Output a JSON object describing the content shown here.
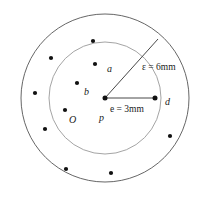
{
  "figure": {
    "colors": {
      "outer_circle_stroke": "#555555",
      "inner_circle_stroke": "#999999",
      "point_fill": "#111111",
      "line_stroke": "#333333",
      "text": "#1a1a1a",
      "background": "#ffffff"
    },
    "geometry": {
      "center_x": 105,
      "center_y": 98,
      "outer_radius": 84,
      "inner_radius": 56
    },
    "labels": {
      "a": "a",
      "b": "b",
      "O": "O",
      "p": "p",
      "d": "d",
      "outer_measure": "ε = 6mm",
      "inner_measure": "e = 3mm"
    },
    "label_positions": {
      "a": {
        "x": 107,
        "y": 64
      },
      "b": {
        "x": 84,
        "y": 87
      },
      "O": {
        "x": 69,
        "y": 115
      },
      "p": {
        "x": 99,
        "y": 113
      },
      "d": {
        "x": 165,
        "y": 97
      },
      "outer_measure": {
        "x": 142,
        "y": 63
      },
      "inner_measure": {
        "x": 110,
        "y": 105
      }
    },
    "points": [
      {
        "name": "point-inner-a",
        "x": 95,
        "y": 64,
        "r": 2.1
      },
      {
        "name": "point-inner-b",
        "x": 77,
        "y": 83,
        "r": 2.1
      },
      {
        "name": "point-inner-o",
        "x": 65,
        "y": 110,
        "r": 2.1
      },
      {
        "name": "point-center-p",
        "x": 105,
        "y": 98,
        "r": 2.4
      },
      {
        "name": "point-d",
        "x": 155,
        "y": 98,
        "r": 2.4
      },
      {
        "name": "point-outer-top",
        "x": 93,
        "y": 41,
        "r": 2.1
      },
      {
        "name": "point-outer-upper-left",
        "x": 51,
        "y": 58,
        "r": 2.1
      },
      {
        "name": "point-outer-left",
        "x": 35,
        "y": 93,
        "r": 2.1
      },
      {
        "name": "point-outer-lower-left",
        "x": 45,
        "y": 129,
        "r": 2.1
      },
      {
        "name": "point-outer-bottom-left",
        "x": 66,
        "y": 169,
        "r": 2.1
      },
      {
        "name": "point-outer-bottom",
        "x": 111,
        "y": 173,
        "r": 2.1
      },
      {
        "name": "point-outer-right",
        "x": 170,
        "y": 136,
        "r": 2.1
      }
    ],
    "lines": [
      {
        "name": "radius-line-outer",
        "x1": 105,
        "y1": 98,
        "x2": 158,
        "y2": 39
      },
      {
        "name": "radius-line-inner",
        "x1": 105,
        "y1": 98,
        "x2": 155,
        "y2": 98
      }
    ]
  }
}
